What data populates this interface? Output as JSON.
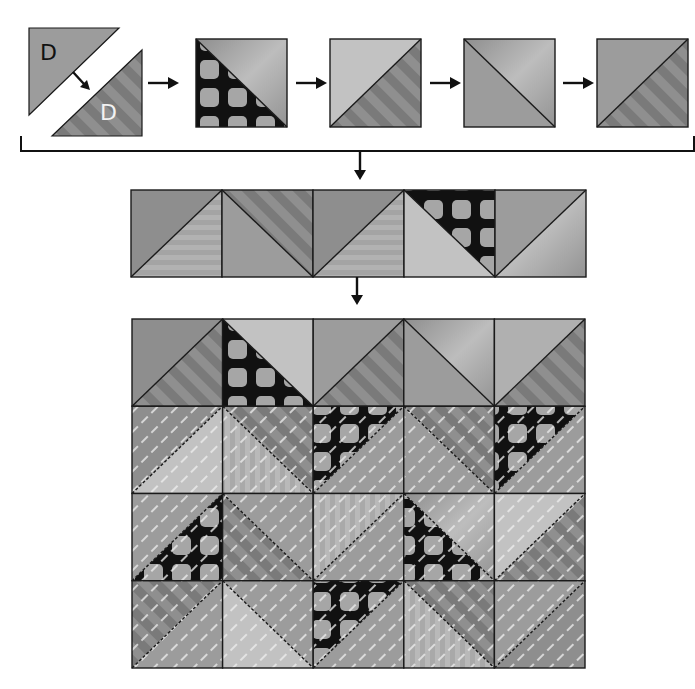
{
  "colors": {
    "outline": "#1a1a1a",
    "medium": "#9c9c9c",
    "medium_dark": "#8e8e8e",
    "light": "#c2c2c2",
    "lighter": "#b0b0b0",
    "stripe_a": "#7a7a7a",
    "stripe_b": "#8f8f8f",
    "polka_bg": "#111111",
    "polka_dot": "#a6a6a6",
    "vstripe_a": "#a9a9a9",
    "vstripe_b": "#b9b9b9",
    "hstripe_a": "#a4a4a4",
    "hstripe_b": "#b2b2b2",
    "quilting": "#eeeeee"
  },
  "step1": {
    "top_triangle_label": "D",
    "bottom_triangle_label": "D"
  },
  "top_row_blocks": [
    {
      "diagonal": "tl-br",
      "a": "polka",
      "b": "grad",
      "a_side": "lower-left"
    },
    {
      "diagonal": "bl-tr",
      "a": "light",
      "b": "stripes",
      "a_side": "upper-left"
    },
    {
      "diagonal": "tl-br",
      "a": "medium",
      "b": "grad",
      "a_side": "lower-left"
    },
    {
      "diagonal": "bl-tr",
      "a": "medium",
      "b": "stripes",
      "a_side": "upper-left"
    }
  ],
  "strip_row": [
    {
      "diagonal": "bl-tr",
      "a": "medium_dark",
      "b": "hstripes"
    },
    {
      "diagonal": "tl-br",
      "a": "medium",
      "b": "stripes"
    },
    {
      "diagonal": "bl-tr",
      "a": "medium_dark",
      "b": "hstripes"
    },
    {
      "diagonal": "tl-br",
      "a": "light",
      "b": "polka"
    },
    {
      "diagonal": "bl-tr",
      "a": "medium",
      "b": "grad"
    }
  ],
  "quilt_grid": {
    "rows": 4,
    "cols": 5,
    "cells": [
      [
        {
          "diagonal": "bl-tr",
          "a": "medium_dark",
          "b": "stripes",
          "quilted": false
        },
        {
          "diagonal": "tl-br",
          "a": "polka",
          "b": "light",
          "quilted": false
        },
        {
          "diagonal": "bl-tr",
          "a": "medium",
          "b": "stripes",
          "quilted": false
        },
        {
          "diagonal": "tl-br",
          "a": "medium",
          "b": "grad",
          "quilted": false
        },
        {
          "diagonal": "bl-tr",
          "a": "lighter",
          "b": "stripes",
          "quilted": false
        }
      ],
      [
        {
          "diagonal": "bl-tr",
          "a": "medium_dark",
          "b": "light",
          "quilted": true
        },
        {
          "diagonal": "tl-br",
          "a": "vstripes",
          "b": "stripes",
          "quilted": true
        },
        {
          "diagonal": "bl-tr",
          "a": "polka",
          "b": "medium",
          "quilted": true
        },
        {
          "diagonal": "tl-br",
          "a": "medium",
          "b": "stripes",
          "quilted": true
        },
        {
          "diagonal": "bl-tr",
          "a": "polka",
          "b": "medium",
          "quilted": true
        }
      ],
      [
        {
          "diagonal": "bl-tr",
          "a": "medium",
          "b": "polka",
          "quilted": true
        },
        {
          "diagonal": "tl-br",
          "a": "stripes",
          "b": "medium",
          "quilted": true
        },
        {
          "diagonal": "bl-tr",
          "a": "vstripes",
          "b": "medium",
          "quilted": true
        },
        {
          "diagonal": "tl-br",
          "a": "polka",
          "b": "grad",
          "quilted": true
        },
        {
          "diagonal": "bl-tr",
          "a": "light",
          "b": "stripes",
          "quilted": true
        }
      ],
      [
        {
          "diagonal": "bl-tr",
          "a": "stripes",
          "b": "medium",
          "quilted": true
        },
        {
          "diagonal": "tl-br",
          "a": "light",
          "b": "medium",
          "quilted": true
        },
        {
          "diagonal": "bl-tr",
          "a": "polka",
          "b": "medium",
          "quilted": true
        },
        {
          "diagonal": "tl-br",
          "a": "vstripes",
          "b": "stripes",
          "quilted": true
        },
        {
          "diagonal": "bl-tr",
          "a": "medium",
          "b": "medium_dark",
          "quilted": true
        }
      ]
    ]
  }
}
